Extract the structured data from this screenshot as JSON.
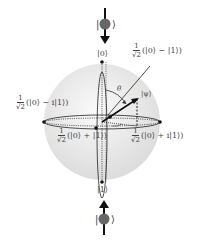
{
  "diagram": {
    "type": "bloch-sphere",
    "colors": {
      "sphere": "#e8e8e8",
      "axis": "#222222",
      "label": "#444444",
      "spin": "#555555"
    },
    "top_spin": {
      "ket": "|↓⟩",
      "arrow_direction": "down"
    },
    "bottom_spin": {
      "ket": "|↑⟩",
      "arrow_direction": "up"
    },
    "labels": {
      "north": "|0⟩",
      "south": "|1⟩",
      "psi": "|ψ⟩",
      "theta": "θ",
      "phi": "φ",
      "minus": {
        "num": "1",
        "den": "√2",
        "expr": "(|0⟩ − |1⟩)"
      },
      "minus_i": {
        "num": "1",
        "den": "√2",
        "expr": "(|0⟩ − i|1⟩)"
      },
      "plus": {
        "num": "1",
        "den": "√2",
        "expr": "(|0⟩ + |1⟩)"
      },
      "plus_i": {
        "num": "1",
        "den": "√2",
        "expr": "(|0⟩ + i|1⟩)"
      }
    }
  }
}
